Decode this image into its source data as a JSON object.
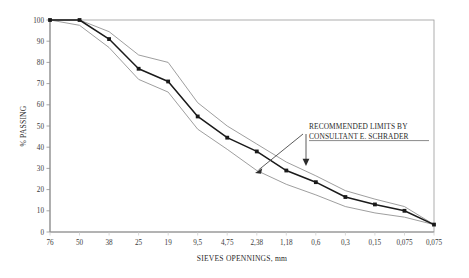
{
  "chart_data": {
    "type": "line",
    "title": "",
    "xlabel": "SIEVES OPENNINGS, mm",
    "ylabel": "% PASSING",
    "ylim": [
      0,
      100
    ],
    "ytick_step": 10,
    "grid": false,
    "legend_position": "none",
    "categories": [
      "76",
      "50",
      "38",
      "25",
      "19",
      "9,5",
      "4,75",
      "2,38",
      "1,18",
      "0,6",
      "0,3",
      "0,15",
      "0,075",
      "0,075"
    ],
    "yticks": [
      "0",
      "10",
      "20",
      "30",
      "40",
      "50",
      "60",
      "70",
      "80",
      "90",
      "100"
    ],
    "series": [
      {
        "name": "gradation-curve",
        "style": "line-with-square-markers",
        "color": "#1a1a1a",
        "markers": true,
        "values": [
          100,
          100,
          91,
          77,
          71,
          54.5,
          44.5,
          38,
          29,
          23.5,
          16.5,
          13,
          10,
          3.5
        ]
      },
      {
        "name": "upper-limit",
        "style": "thin-line",
        "color": "#8c8c8c",
        "markers": false,
        "values": [
          100,
          100,
          94.5,
          83.5,
          80,
          61,
          50,
          41.5,
          33,
          26.5,
          19.5,
          15.5,
          12,
          3.5
        ]
      },
      {
        "name": "lower-limit",
        "style": "thin-line",
        "color": "#8c8c8c",
        "markers": false,
        "values": [
          100,
          97.5,
          87,
          72,
          66,
          48.5,
          39,
          29,
          22.5,
          17.5,
          12,
          9,
          7,
          3.5
        ]
      }
    ],
    "annotations": [
      {
        "name": "recommended-limits-note",
        "line1": "RECOMMENDED LIMITS BY",
        "line2": "CONSULTANT E. SCHRADER",
        "arrow_targets": [
          "lower-limit",
          "upper-limit"
        ]
      }
    ]
  },
  "colors": {
    "series_main": "#1a1a1a",
    "limit_lines": "#8c8c8c",
    "axis": "#8f8f8f",
    "text": "#2b2b2b",
    "background": "#ffffff"
  }
}
